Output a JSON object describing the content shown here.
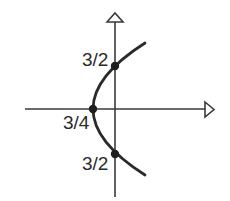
{
  "diagram": {
    "type": "parabola-graph",
    "colors": {
      "background": "#ffffff",
      "stroke": "#2a2a2a",
      "axis": "#3a3a3a"
    },
    "axes": {
      "x_axis": {
        "arrow": "open-triangle-right"
      },
      "y_axis": {
        "arrow": "open-triangle-up"
      }
    },
    "points": [
      {
        "name": "upper-y-intercept",
        "label": "3/2"
      },
      {
        "name": "vertex",
        "label": "3/4"
      },
      {
        "name": "lower-y-intercept",
        "label": "3/2"
      }
    ]
  }
}
